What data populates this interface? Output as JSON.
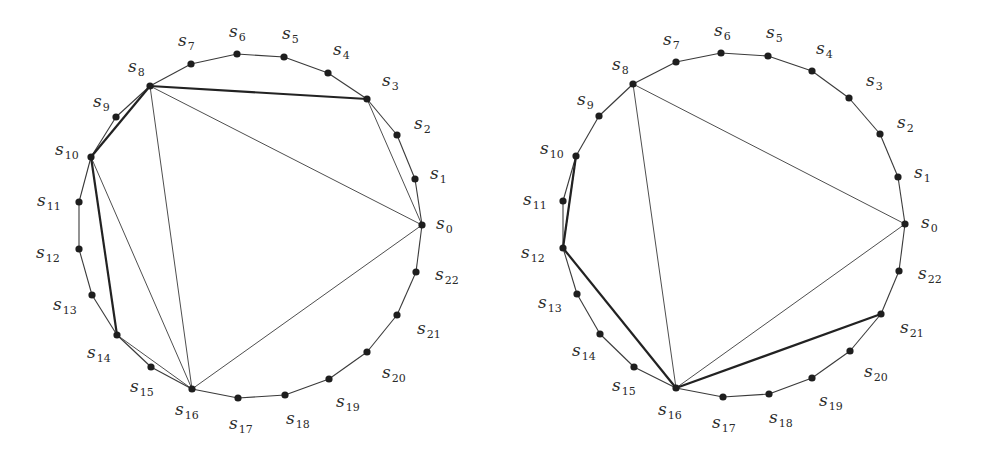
{
  "figure": {
    "background": "#ffffff",
    "line_color": "#3a3a3a",
    "vertex_color": "#1e1e1e",
    "diagrams": [
      {
        "id": "left",
        "vertices": [
          {
            "name": "s",
            "sub": "0",
            "x": 422,
            "y": 225,
            "lx": 436,
            "ly": 229
          },
          {
            "name": "s",
            "sub": "1",
            "x": 415,
            "y": 179,
            "lx": 430,
            "ly": 179
          },
          {
            "name": "s",
            "sub": "2",
            "x": 397,
            "y": 135,
            "lx": 414,
            "ly": 129
          },
          {
            "name": "s",
            "sub": "3",
            "x": 367,
            "y": 99,
            "lx": 382,
            "ly": 86
          },
          {
            "name": "s",
            "sub": "4",
            "x": 328,
            "y": 73,
            "lx": 333,
            "ly": 55
          },
          {
            "name": "s",
            "sub": "5",
            "x": 284,
            "y": 57,
            "lx": 282,
            "ly": 39
          },
          {
            "name": "s",
            "sub": "6",
            "x": 237,
            "y": 54,
            "lx": 229,
            "ly": 37
          },
          {
            "name": "s",
            "sub": "7",
            "x": 191,
            "y": 64,
            "lx": 178,
            "ly": 46
          },
          {
            "name": "s",
            "sub": "8",
            "x": 150,
            "y": 86,
            "lx": 128,
            "ly": 72
          },
          {
            "name": "s",
            "sub": "9",
            "x": 116,
            "y": 117,
            "lx": 93,
            "ly": 107
          },
          {
            "name": "s",
            "sub": "10",
            "x": 91,
            "y": 157,
            "lx": 55,
            "ly": 155
          },
          {
            "name": "s",
            "sub": "11",
            "x": 79,
            "y": 202,
            "lx": 37,
            "ly": 206
          },
          {
            "name": "s",
            "sub": "12",
            "x": 79,
            "y": 249,
            "lx": 36,
            "ly": 258
          },
          {
            "name": "s",
            "sub": "13",
            "x": 92,
            "y": 295,
            "lx": 53,
            "ly": 310
          },
          {
            "name": "s",
            "sub": "14",
            "x": 117,
            "y": 335,
            "lx": 87,
            "ly": 358
          },
          {
            "name": "s",
            "sub": "15",
            "x": 151,
            "y": 367,
            "lx": 130,
            "ly": 392
          },
          {
            "name": "s",
            "sub": "16",
            "x": 192,
            "y": 389,
            "lx": 175,
            "ly": 415
          },
          {
            "name": "s",
            "sub": "17",
            "x": 238,
            "y": 398,
            "lx": 229,
            "ly": 429
          },
          {
            "name": "s",
            "sub": "18",
            "x": 285,
            "y": 395,
            "lx": 286,
            "ly": 424
          },
          {
            "name": "s",
            "sub": "19",
            "x": 329,
            "y": 379,
            "lx": 336,
            "ly": 407
          },
          {
            "name": "s",
            "sub": "20",
            "x": 367,
            "y": 352,
            "lx": 382,
            "ly": 378
          },
          {
            "name": "s",
            "sub": "21",
            "x": 397,
            "y": 315,
            "lx": 417,
            "ly": 334
          },
          {
            "name": "s",
            "sub": "22",
            "x": 416,
            "y": 272,
            "lx": 435,
            "ly": 280
          }
        ],
        "thin_chords": [
          [
            3,
            0
          ],
          [
            8,
            0
          ],
          [
            8,
            16
          ],
          [
            16,
            0
          ],
          [
            10,
            16
          ],
          [
            14,
            16
          ],
          [
            8,
            10
          ]
        ],
        "thick_chords": [
          [
            8,
            3
          ],
          [
            8,
            10
          ],
          [
            10,
            14
          ]
        ]
      },
      {
        "id": "right",
        "vertices": [
          {
            "name": "s",
            "sub": "0",
            "x": 905,
            "y": 224,
            "lx": 921,
            "ly": 228
          },
          {
            "name": "s",
            "sub": "1",
            "x": 898,
            "y": 177,
            "lx": 914,
            "ly": 178
          },
          {
            "name": "s",
            "sub": "2",
            "x": 880,
            "y": 134,
            "lx": 897,
            "ly": 128
          },
          {
            "name": "s",
            "sub": "3",
            "x": 849,
            "y": 98,
            "lx": 866,
            "ly": 86
          },
          {
            "name": "s",
            "sub": "4",
            "x": 812,
            "y": 71,
            "lx": 816,
            "ly": 54
          },
          {
            "name": "s",
            "sub": "5",
            "x": 768,
            "y": 56,
            "lx": 766,
            "ly": 38
          },
          {
            "name": "s",
            "sub": "6",
            "x": 721,
            "y": 53,
            "lx": 714,
            "ly": 36
          },
          {
            "name": "s",
            "sub": "7",
            "x": 676,
            "y": 62,
            "lx": 663,
            "ly": 45
          },
          {
            "name": "s",
            "sub": "8",
            "x": 633,
            "y": 84,
            "lx": 612,
            "ly": 70
          },
          {
            "name": "s",
            "sub": "9",
            "x": 599,
            "y": 116,
            "lx": 577,
            "ly": 105
          },
          {
            "name": "s",
            "sub": "10",
            "x": 576,
            "y": 156,
            "lx": 540,
            "ly": 154
          },
          {
            "name": "s",
            "sub": "11",
            "x": 563,
            "y": 201,
            "lx": 523,
            "ly": 205
          },
          {
            "name": "s",
            "sub": "12",
            "x": 563,
            "y": 248,
            "lx": 521,
            "ly": 258
          },
          {
            "name": "s",
            "sub": "13",
            "x": 577,
            "y": 294,
            "lx": 538,
            "ly": 308
          },
          {
            "name": "s",
            "sub": "14",
            "x": 600,
            "y": 334,
            "lx": 572,
            "ly": 356
          },
          {
            "name": "s",
            "sub": "15",
            "x": 634,
            "y": 367,
            "lx": 612,
            "ly": 391
          },
          {
            "name": "s",
            "sub": "16",
            "x": 676,
            "y": 388,
            "lx": 658,
            "ly": 415
          },
          {
            "name": "s",
            "sub": "17",
            "x": 723,
            "y": 397,
            "lx": 712,
            "ly": 428
          },
          {
            "name": "s",
            "sub": "18",
            "x": 769,
            "y": 394,
            "lx": 769,
            "ly": 423
          },
          {
            "name": "s",
            "sub": "19",
            "x": 812,
            "y": 378,
            "lx": 819,
            "ly": 406
          },
          {
            "name": "s",
            "sub": "20",
            "x": 850,
            "y": 351,
            "lx": 864,
            "ly": 377
          },
          {
            "name": "s",
            "sub": "21",
            "x": 881,
            "y": 314,
            "lx": 900,
            "ly": 333
          },
          {
            "name": "s",
            "sub": "22",
            "x": 899,
            "y": 271,
            "lx": 918,
            "ly": 279
          }
        ],
        "thin_chords": [
          [
            8,
            0
          ],
          [
            8,
            16
          ],
          [
            16,
            0
          ],
          [
            10,
            12
          ]
        ],
        "thick_chords": [
          [
            10,
            12
          ],
          [
            12,
            16
          ],
          [
            16,
            21
          ]
        ]
      }
    ]
  }
}
